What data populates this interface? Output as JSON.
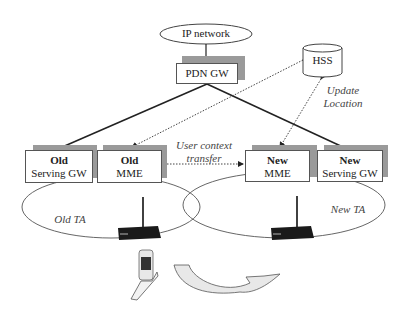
{
  "diagram": {
    "ip_network": {
      "label": "IP network"
    },
    "pdn_gw": {
      "label": "PDN GW"
    },
    "hss": {
      "label": "HSS"
    },
    "update_location": {
      "line1": "Update",
      "line2": "Location"
    },
    "user_context_transfer": {
      "line1": "User context",
      "line2": "transfer"
    },
    "old_serving_gw": {
      "line1": "Old",
      "line2": "Serving GW"
    },
    "old_mme": {
      "line1": "Old",
      "line2": "MME"
    },
    "new_mme": {
      "line1": "New",
      "line2": "MME"
    },
    "new_serving_gw": {
      "line1": "New",
      "line2": "Serving GW"
    },
    "old_ta": {
      "label": "Old TA"
    },
    "new_ta": {
      "label": "New TA"
    },
    "icons": [
      "router-icon",
      "router-icon",
      "mobile-phone-icon",
      "curved-arrow-icon"
    ],
    "colors": {
      "shadow": "#9a9a9a",
      "line": "#222222",
      "arrow_fill": "#e8e8e8"
    }
  }
}
